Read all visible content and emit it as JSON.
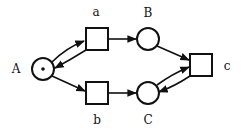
{
  "diagram": {
    "type": "petri-net",
    "places": [
      {
        "id": "A",
        "label": "A",
        "cx": 43,
        "cy": 69,
        "r": 11,
        "tokens": 1,
        "label_x": 16,
        "label_y": 73
      },
      {
        "id": "B",
        "label": "B",
        "cx": 148,
        "cy": 39,
        "r": 11,
        "tokens": 0,
        "label_x": 148,
        "label_y": 17
      },
      {
        "id": "C",
        "label": "C",
        "cx": 148,
        "cy": 93,
        "r": 11,
        "tokens": 0,
        "label_x": 148,
        "label_y": 124
      }
    ],
    "transitions": [
      {
        "id": "a",
        "label": "a",
        "x": 86,
        "y": 28,
        "w": 22,
        "h": 22,
        "label_x": 96,
        "label_y": 16
      },
      {
        "id": "b",
        "label": "b",
        "x": 86,
        "y": 82,
        "w": 22,
        "h": 22,
        "label_x": 97,
        "label_y": 124
      },
      {
        "id": "c",
        "label": "c",
        "x": 190,
        "y": 54,
        "w": 22,
        "h": 22,
        "label_x": 227,
        "label_y": 70
      }
    ],
    "arcs": [
      {
        "from": "A",
        "to": "a"
      },
      {
        "from": "a",
        "to": "A"
      },
      {
        "from": "A",
        "to": "b"
      },
      {
        "from": "a",
        "to": "B"
      },
      {
        "from": "b",
        "to": "C"
      },
      {
        "from": "B",
        "to": "c"
      },
      {
        "from": "C",
        "to": "c"
      },
      {
        "from": "c",
        "to": "C"
      }
    ]
  }
}
